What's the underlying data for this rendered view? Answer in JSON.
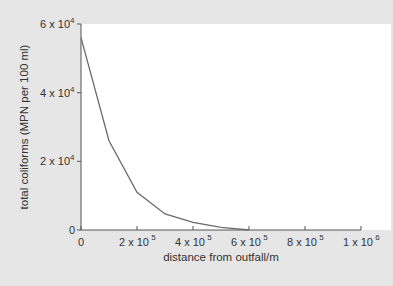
{
  "chart_data": {
    "type": "line",
    "title": "",
    "xlabel": "distance from outfall/m",
    "ylabel": "total coliforms (MPN per 100 ml)",
    "xlim": [
      0,
      1000000
    ],
    "ylim": [
      0,
      60000
    ],
    "grid": false,
    "legend": null,
    "x_ticks": [
      {
        "value": 0,
        "label": "0",
        "sup": ""
      },
      {
        "value": 200000,
        "label": "2 x 10",
        "sup": "5"
      },
      {
        "value": 400000,
        "label": "4 x 10",
        "sup": "5"
      },
      {
        "value": 600000,
        "label": "6 x 10",
        "sup": "5"
      },
      {
        "value": 800000,
        "label": "8 x 10",
        "sup": "5"
      },
      {
        "value": 1000000,
        "label": "1 x 10",
        "sup": "6"
      }
    ],
    "y_ticks": [
      {
        "value": 0,
        "label": "0",
        "sup": ""
      },
      {
        "value": 20000,
        "label": "2 x 10",
        "sup": "4"
      },
      {
        "value": 40000,
        "label": "4 x 10",
        "sup": "4"
      },
      {
        "value": 60000,
        "label": "6 x 10",
        "sup": "4"
      }
    ],
    "series": [
      {
        "name": "total coliforms",
        "color": "#6b6b6b",
        "x": [
          0,
          100000,
          200000,
          300000,
          400000,
          500000,
          600000
        ],
        "y": [
          56000,
          26000,
          11000,
          4700,
          2200,
          800,
          0
        ]
      }
    ]
  },
  "colors": {
    "panel_background": "#e6e6e6",
    "plot_background": "#ffffff",
    "axis": "#555555",
    "line": "#6b6b6b"
  }
}
